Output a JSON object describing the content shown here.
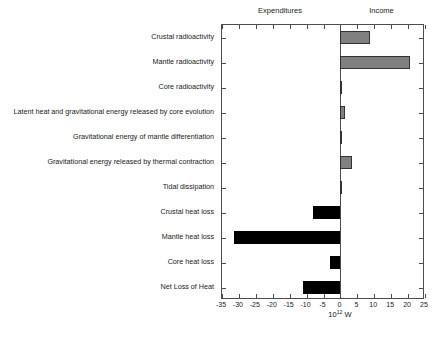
{
  "chart_data": {
    "type": "bar",
    "orientation": "horizontal",
    "title": "",
    "xlabel": "10^12 W",
    "xlabel_mantissa": "10",
    "xlabel_exponent": "12",
    "xlabel_unit": " W",
    "ylabel": "",
    "xlim": [
      -35,
      25
    ],
    "xticks": [
      -35,
      -30,
      -25,
      -20,
      -15,
      -10,
      -5,
      0,
      5,
      10,
      15,
      20,
      25
    ],
    "xticklabels": [
      "-35",
      "-30",
      "-25",
      "-20",
      "-15",
      "-10",
      "-5",
      "0",
      "5",
      "10",
      "15",
      "20",
      "25"
    ],
    "grid": false,
    "zero_line": 0,
    "column_headings": [
      {
        "label": "Expenditures",
        "side": "left"
      },
      {
        "label": "Income",
        "side": "right"
      }
    ],
    "series": [
      {
        "name": "Earth heat budget",
        "positive_color": "#808080",
        "negative_color": "#000000"
      }
    ],
    "categories": [
      "Crustal radioactivity",
      "Mantle radioactivity",
      "Core radioactivity",
      "Latent heat and gravitational energy released by core evolution",
      "Gravitational energy of mantle differentiation",
      "Gravitational energy released by thermal contraction",
      "Tidal dissipation",
      "Crustal heat loss",
      "Mantle heat loss",
      "Core heat loss",
      "Net Loss of Heat"
    ],
    "values": [
      8.8,
      20.5,
      0.3,
      1.5,
      0.3,
      3.5,
      0.3,
      -8.0,
      -31.5,
      -3.0,
      -11.0
    ]
  },
  "colors": {
    "positive_bar": "#808080",
    "negative_bar": "#000000",
    "axis": "#4d4d4d",
    "text": "#1a1a1a",
    "background": "#ffffff"
  }
}
